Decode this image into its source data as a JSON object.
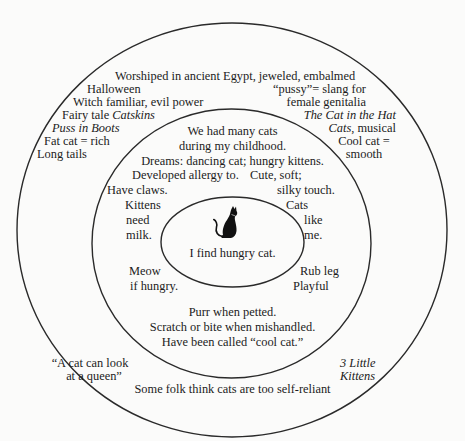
{
  "diagram": {
    "type": "concentric-circles",
    "subject": "cat",
    "rings": {
      "inner": {
        "icon": "cat-silhouette-icon",
        "label": "I find hungry cat."
      },
      "middle": {
        "top_lines": [
          "We had many cats",
          "during my childhood.",
          "Dreams: dancing cat; hungry kittens."
        ],
        "allergy": "Developed allergy to.",
        "cute": [
          "Cute, soft;",
          "silky touch."
        ],
        "claws": "Have claws.",
        "kittens": [
          "Kittens",
          "need",
          "milk."
        ],
        "cats_like_me": [
          "Cats",
          "like",
          "me."
        ],
        "meow": [
          "Meow",
          "if hungry."
        ],
        "rub": [
          "Rub leg",
          "Playful"
        ],
        "bottom_lines": [
          "Purr when petted.",
          "Scratch or bite when mishandled.",
          "Have been called “cool cat.”"
        ]
      },
      "outer": {
        "egypt": "Worshiped in ancient Egypt, jeweled, embalmed",
        "halloween": "Halloween",
        "witch": "Witch familiar, evil power",
        "fairy_prefix": "Fairy tale ",
        "fairy_title": "Catskins",
        "puss": "Puss in Boots",
        "fat": "Fat cat = rich",
        "tails": "Long tails",
        "slang": [
          "“pussy”= slang for",
          "female genitalia"
        ],
        "hat": "The Cat in the Hat",
        "musical_title": "Cats",
        "musical_suffix": ", musical",
        "cool": [
          "Cool cat =",
          "smooth"
        ],
        "queen": [
          "“A cat can look",
          "at a queen”"
        ],
        "little": [
          "3 Little",
          "Kittens"
        ],
        "selfreliant": "Some folk think cats are too self-reliant"
      }
    },
    "colors": {
      "stroke": "#2a2a2a",
      "background": "#fbfbfa",
      "text": "#1c1c1c"
    }
  }
}
